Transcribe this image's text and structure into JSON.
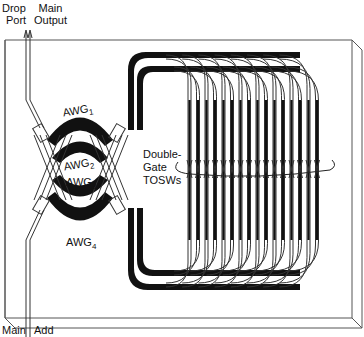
{
  "labels": {
    "drop_port_line1": "Drop",
    "drop_port_line2": "Port",
    "main_output_line1": "Main",
    "main_output_line2": "Output",
    "main_input": "Main",
    "add_port": "Add",
    "awg1": "AWG",
    "awg1_sub": "1",
    "awg2": "AWG",
    "awg2_sub": "2",
    "awg3": "AWG",
    "awg3_sub": "3",
    "awg4": "AWG",
    "awg4_sub": "4",
    "tosw_line1": "Double-",
    "tosw_line2": "Gate",
    "tosw_line3": "TOSWs"
  },
  "colors": {
    "line": "#222222",
    "fill": "#111111",
    "chip_edge": "#555555",
    "background": "#ffffff"
  },
  "diagram": {
    "switch_count": 16
  }
}
